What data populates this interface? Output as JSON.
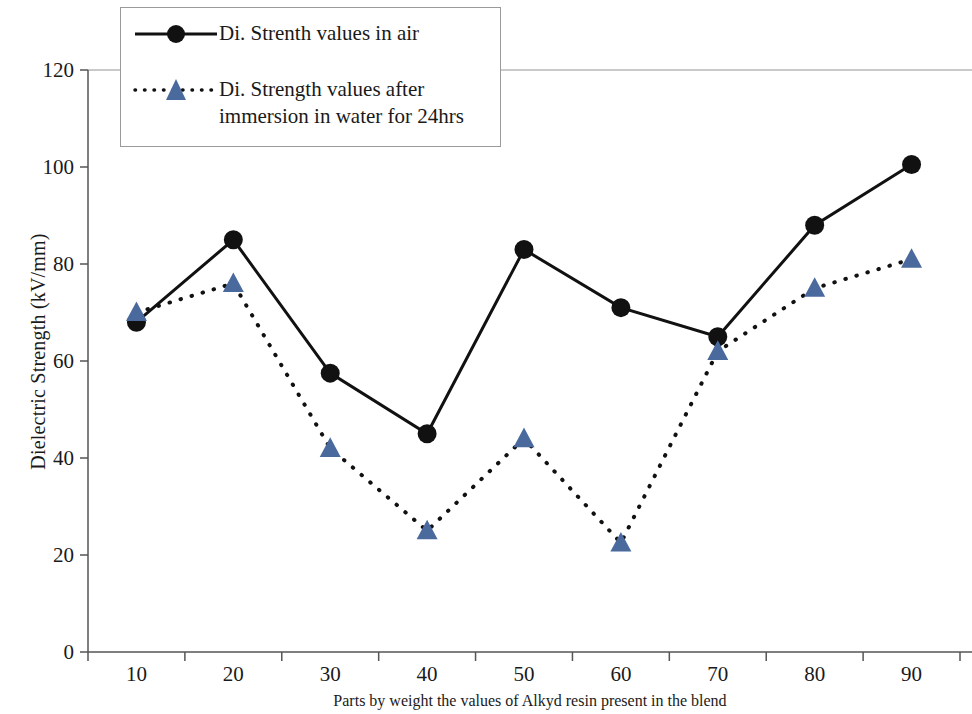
{
  "chart_data": {
    "type": "line",
    "title": "",
    "xlabel": "Parts by weight the values of Alkyd resin present in the blend",
    "ylabel": "Dielectric Strength (kV/mm)",
    "categories": [
      10,
      20,
      30,
      40,
      50,
      60,
      70,
      80,
      90
    ],
    "xtick_labels": [
      "10",
      "20",
      "30",
      "40",
      "50",
      "60",
      "70",
      "80",
      "90"
    ],
    "ytick_labels": [
      "0",
      "20",
      "40",
      "60",
      "80",
      "100",
      "120"
    ],
    "yticks": [
      0,
      20,
      40,
      60,
      80,
      100,
      120
    ],
    "ylim": [
      0,
      120
    ],
    "grid": "single gridline at y=120",
    "legend_position": "top-left inside plot",
    "series": [
      {
        "name": "Di. Strenth values in air",
        "marker": "circle",
        "line_style": "solid",
        "color": "#111111",
        "values": [
          68,
          85,
          57.5,
          45,
          83,
          71,
          65,
          88,
          100.5
        ]
      },
      {
        "name": "Di. Strength values after\nimmersion in water for 24hrs",
        "marker": "triangle",
        "line_style": "dotted",
        "color": "#4a6a9e",
        "line_color": "#111111",
        "values": [
          70,
          76,
          42,
          25,
          44,
          22.5,
          62,
          75,
          81
        ]
      }
    ]
  },
  "legend": {
    "items": [
      {
        "label": "Di. Strenth values in air"
      },
      {
        "label": "Di. Strength values after\nimmersion in water for 24hrs"
      }
    ]
  },
  "colors": {
    "series_air": "#111111",
    "series_water": "#4a6a9e",
    "axis": "#555555",
    "gridline": "#c9c9c9"
  }
}
